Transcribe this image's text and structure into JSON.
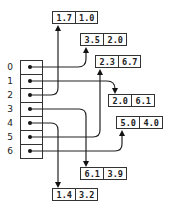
{
  "diagram": {
    "type": "pointer-array",
    "array": {
      "indices": [
        "0",
        "1",
        "2",
        "3",
        "4",
        "5",
        "6"
      ]
    },
    "pairs": [
      {
        "id": "p0",
        "a": "3.5",
        "b": "2.0",
        "pointed_by": "0"
      },
      {
        "id": "p1",
        "a": "2.0",
        "b": "6.1",
        "pointed_by": "1"
      },
      {
        "id": "p2",
        "a": "1.7",
        "b": "1.0",
        "pointed_by": "2"
      },
      {
        "id": "p3",
        "a": "6.1",
        "b": "3.9",
        "pointed_by": "3"
      },
      {
        "id": "p4",
        "a": "1.4",
        "b": "3.2",
        "pointed_by": "4"
      },
      {
        "id": "p5",
        "a": "2.3",
        "b": "6.7",
        "pointed_by": "5"
      },
      {
        "id": "p6",
        "a": "5.0",
        "b": "4.0",
        "pointed_by": "6"
      }
    ],
    "colors": {
      "line": "#222222",
      "background": "#ffffff"
    }
  }
}
